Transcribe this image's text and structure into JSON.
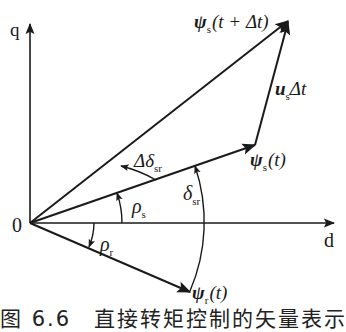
{
  "diagram": {
    "type": "vector-diagram",
    "axes": {
      "q_label": "q",
      "d_label": "d",
      "origin_label": "0"
    },
    "vectors": [
      {
        "id": "psi_s_t_dt",
        "label_main": "ψ",
        "label_sub": "s",
        "label_arg": "(t + Δt)"
      },
      {
        "id": "psi_s_t",
        "label_main": "ψ",
        "label_sub": "s",
        "label_arg": "(t)"
      },
      {
        "id": "psi_r_t",
        "label_main": "ψ",
        "label_sub": "r",
        "label_arg": "(t)"
      },
      {
        "id": "us_dt",
        "label_main": "u",
        "label_sub": "s",
        "label_arg": "Δt"
      }
    ],
    "angles": [
      {
        "id": "delta_delta_sr",
        "label_main": "Δδ",
        "label_sub": "sr"
      },
      {
        "id": "delta_sr",
        "label_main": "δ",
        "label_sub": "sr"
      },
      {
        "id": "rho_s",
        "label_main": "ρ",
        "label_sub": "s"
      },
      {
        "id": "rho_r",
        "label_main": "ρ",
        "label_sub": "r"
      }
    ],
    "caption": "图 6.6　直接转矩控制的矢量表示",
    "colors": {
      "line": "#1a1a1a",
      "background": "#ffffff"
    }
  }
}
